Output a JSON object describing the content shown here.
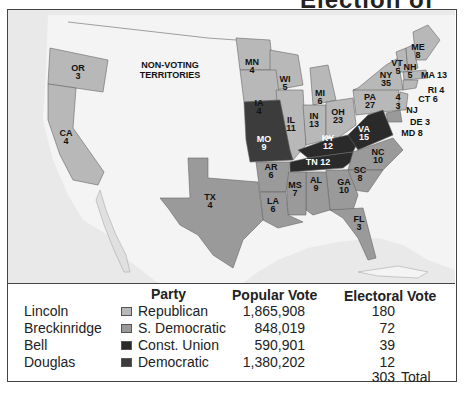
{
  "title": "Election of 1860",
  "map": {
    "territories_label": [
      "NON-VOTING",
      "TERRITORIES"
    ],
    "colors": {
      "republican": "#b8b8b8",
      "s_democratic": "#9a9a9a",
      "const_union": "#2a2a2a",
      "democratic": "#3c3c3c",
      "water": "#e8e8e8",
      "land_other": "#f4f4f4"
    },
    "states": [
      {
        "abbr": "OR",
        "ev": "3",
        "party": "republican"
      },
      {
        "abbr": "CA",
        "ev": "4",
        "party": "republican"
      },
      {
        "abbr": "MN",
        "ev": "4",
        "party": "republican"
      },
      {
        "abbr": "WI",
        "ev": "5",
        "party": "republican"
      },
      {
        "abbr": "IA",
        "ev": "4",
        "party": "republican"
      },
      {
        "abbr": "MI",
        "ev": "6",
        "party": "republican"
      },
      {
        "abbr": "IL",
        "ev": "11",
        "party": "republican"
      },
      {
        "abbr": "IN",
        "ev": "13",
        "party": "republican"
      },
      {
        "abbr": "OH",
        "ev": "23",
        "party": "republican"
      },
      {
        "abbr": "PA",
        "ev": "27",
        "party": "republican"
      },
      {
        "abbr": "NY",
        "ev": "35",
        "party": "republican"
      },
      {
        "abbr": "VT",
        "ev": "5",
        "party": "republican"
      },
      {
        "abbr": "NH",
        "ev": "5",
        "party": "republican"
      },
      {
        "abbr": "ME",
        "ev": "8",
        "party": "republican"
      },
      {
        "abbr": "MA",
        "ev": "13",
        "party": "republican"
      },
      {
        "abbr": "RI",
        "ev": "4",
        "party": "republican"
      },
      {
        "abbr": "CT",
        "ev": "6",
        "party": "republican"
      },
      {
        "abbr": "NJ",
        "ev": "4 / 3",
        "party": "split"
      },
      {
        "abbr": "DE",
        "ev": "3",
        "party": "s_democratic"
      },
      {
        "abbr": "MD",
        "ev": "8",
        "party": "s_democratic"
      },
      {
        "abbr": "MO",
        "ev": "9",
        "party": "democratic"
      },
      {
        "abbr": "KY",
        "ev": "12",
        "party": "const_union"
      },
      {
        "abbr": "VA",
        "ev": "15",
        "party": "const_union"
      },
      {
        "abbr": "TN",
        "ev": "12",
        "party": "const_union"
      },
      {
        "abbr": "NC",
        "ev": "10",
        "party": "s_democratic"
      },
      {
        "abbr": "SC",
        "ev": "8",
        "party": "s_democratic"
      },
      {
        "abbr": "GA",
        "ev": "10",
        "party": "s_democratic"
      },
      {
        "abbr": "AL",
        "ev": "9",
        "party": "s_democratic"
      },
      {
        "abbr": "MS",
        "ev": "7",
        "party": "s_democratic"
      },
      {
        "abbr": "LA",
        "ev": "6",
        "party": "s_democratic"
      },
      {
        "abbr": "AR",
        "ev": "6",
        "party": "s_democratic"
      },
      {
        "abbr": "TX",
        "ev": "4",
        "party": "s_democratic"
      },
      {
        "abbr": "FL",
        "ev": "3",
        "party": "s_democratic"
      }
    ],
    "nj_split": {
      "a": "4",
      "b": "3"
    }
  },
  "legend": {
    "headers": {
      "party": "Party",
      "popular": "Popular Vote",
      "electoral": "Electoral Vote"
    },
    "rows": [
      {
        "candidate": "Lincoln",
        "party": "Republican",
        "popular": "1,865,908",
        "electoral": "180",
        "swatch": "#b8b8b8"
      },
      {
        "candidate": "Breckinridge",
        "party": "S. Democratic",
        "popular": "848,019",
        "electoral": "72",
        "swatch": "#9a9a9a"
      },
      {
        "candidate": "Bell",
        "party": "Const. Union",
        "popular": "590,901",
        "electoral": "39",
        "swatch": "#2a2a2a"
      },
      {
        "candidate": "Douglas",
        "party": "Democratic",
        "popular": "1,380,202",
        "electoral": "12",
        "swatch": "#3c3c3c"
      }
    ],
    "total_value": "303",
    "total_label": "Total"
  }
}
